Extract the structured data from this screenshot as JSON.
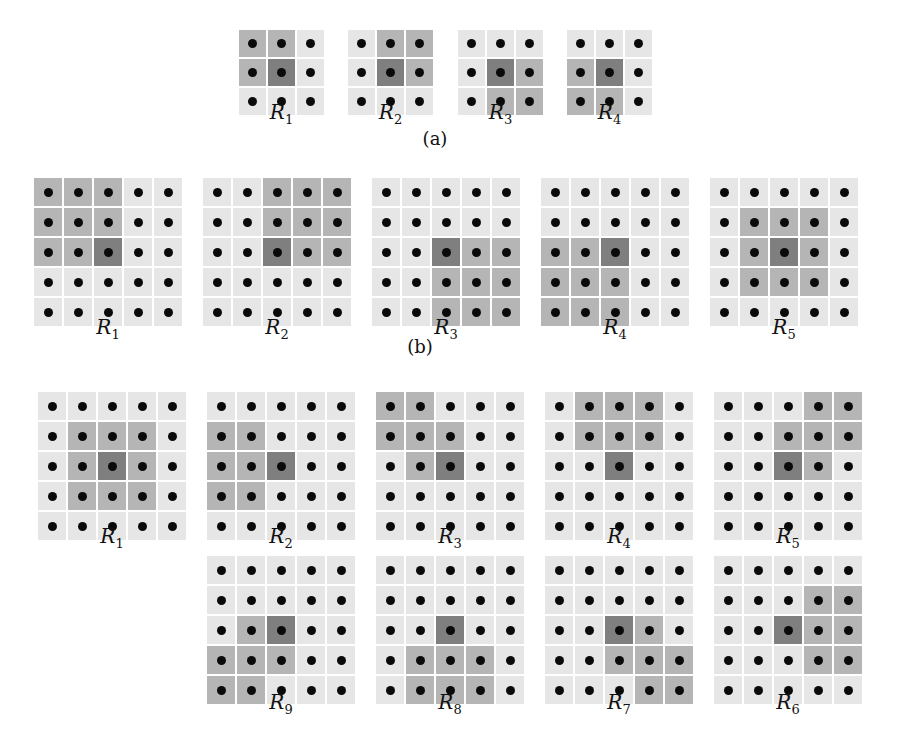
{
  "colors": {
    "light": "#e6e6e6",
    "medium": "#b5b5b5",
    "dark": "#7f7f7f",
    "dot": "#0a0a0a"
  },
  "panels": [
    {
      "caption": "(a)",
      "caption_x": 435,
      "caption_y": 128,
      "size": 3,
      "cell": 27,
      "gap": 2,
      "y": 30,
      "label_y": 100,
      "regions": [
        {
          "label": "R",
          "sub": "1",
          "x": 239,
          "shaded": [
            [
              0,
              0
            ],
            [
              0,
              1
            ],
            [
              1,
              0
            ]
          ]
        },
        {
          "label": "R",
          "sub": "2",
          "x": 348,
          "shaded": [
            [
              0,
              1
            ],
            [
              0,
              2
            ],
            [
              1,
              2
            ]
          ]
        },
        {
          "label": "R",
          "sub": "3",
          "x": 458,
          "shaded": [
            [
              1,
              2
            ],
            [
              2,
              1
            ],
            [
              2,
              2
            ]
          ]
        },
        {
          "label": "R",
          "sub": "4",
          "x": 567,
          "shaded": [
            [
              1,
              0
            ],
            [
              2,
              0
            ],
            [
              2,
              1
            ]
          ]
        }
      ]
    },
    {
      "caption": "(b)",
      "caption_x": 420,
      "caption_y": 336,
      "size": 5,
      "cell": 28,
      "gap": 2,
      "y": 178,
      "label_y": 315,
      "regions": [
        {
          "label": "R",
          "sub": "1",
          "x": 34,
          "shaded": [
            [
              0,
              0
            ],
            [
              0,
              1
            ],
            [
              0,
              2
            ],
            [
              1,
              0
            ],
            [
              1,
              1
            ],
            [
              1,
              2
            ],
            [
              2,
              0
            ],
            [
              2,
              1
            ]
          ]
        },
        {
          "label": "R",
          "sub": "2",
          "x": 203,
          "shaded": [
            [
              0,
              2
            ],
            [
              0,
              3
            ],
            [
              0,
              4
            ],
            [
              1,
              2
            ],
            [
              1,
              3
            ],
            [
              1,
              4
            ],
            [
              2,
              3
            ],
            [
              2,
              4
            ]
          ]
        },
        {
          "label": "R",
          "sub": "3",
          "x": 372,
          "shaded": [
            [
              2,
              3
            ],
            [
              2,
              4
            ],
            [
              3,
              2
            ],
            [
              3,
              3
            ],
            [
              3,
              4
            ],
            [
              4,
              2
            ],
            [
              4,
              3
            ],
            [
              4,
              4
            ]
          ]
        },
        {
          "label": "R",
          "sub": "4",
          "x": 541,
          "shaded": [
            [
              2,
              0
            ],
            [
              2,
              1
            ],
            [
              3,
              0
            ],
            [
              3,
              1
            ],
            [
              3,
              2
            ],
            [
              4,
              0
            ],
            [
              4,
              1
            ],
            [
              4,
              2
            ]
          ]
        },
        {
          "label": "R",
          "sub": "5",
          "x": 710,
          "shaded": [
            [
              1,
              1
            ],
            [
              1,
              2
            ],
            [
              1,
              3
            ],
            [
              2,
              1
            ],
            [
              2,
              3
            ],
            [
              3,
              1
            ],
            [
              3,
              2
            ],
            [
              3,
              3
            ]
          ]
        }
      ]
    },
    {
      "caption": "",
      "size": 5,
      "cell": 28,
      "gap": 2,
      "y": 392,
      "label_y": 524,
      "regions": [
        {
          "label": "R",
          "sub": "1",
          "x": 38,
          "shaded": [
            [
              1,
              1
            ],
            [
              1,
              2
            ],
            [
              1,
              3
            ],
            [
              2,
              1
            ],
            [
              2,
              3
            ],
            [
              3,
              1
            ],
            [
              3,
              2
            ],
            [
              3,
              3
            ]
          ]
        },
        {
          "label": "R",
          "sub": "2",
          "x": 207,
          "shaded": [
            [
              1,
              0
            ],
            [
              1,
              1
            ],
            [
              2,
              0
            ],
            [
              2,
              1
            ],
            [
              3,
              0
            ],
            [
              3,
              1
            ]
          ]
        },
        {
          "label": "R",
          "sub": "3",
          "x": 376,
          "shaded": [
            [
              0,
              0
            ],
            [
              0,
              1
            ],
            [
              1,
              0
            ],
            [
              1,
              1
            ],
            [
              1,
              2
            ],
            [
              2,
              1
            ]
          ]
        },
        {
          "label": "R",
          "sub": "4",
          "x": 545,
          "shaded": [
            [
              0,
              1
            ],
            [
              0,
              2
            ],
            [
              0,
              3
            ],
            [
              1,
              1
            ],
            [
              1,
              2
            ],
            [
              1,
              3
            ]
          ]
        },
        {
          "label": "R",
          "sub": "5",
          "x": 714,
          "shaded": [
            [
              0,
              3
            ],
            [
              0,
              4
            ],
            [
              1,
              2
            ],
            [
              1,
              3
            ],
            [
              1,
              4
            ],
            [
              2,
              3
            ]
          ]
        }
      ]
    },
    {
      "caption": "",
      "size": 5,
      "cell": 28,
      "gap": 2,
      "y": 556,
      "label_y": 690,
      "regions": [
        {
          "label": "R",
          "sub": "9",
          "x": 207,
          "shaded": [
            [
              2,
              1
            ],
            [
              3,
              0
            ],
            [
              3,
              1
            ],
            [
              3,
              2
            ],
            [
              4,
              0
            ],
            [
              4,
              1
            ]
          ]
        },
        {
          "label": "R",
          "sub": "8",
          "x": 376,
          "shaded": [
            [
              3,
              1
            ],
            [
              3,
              2
            ],
            [
              3,
              3
            ],
            [
              4,
              1
            ],
            [
              4,
              2
            ],
            [
              4,
              3
            ]
          ]
        },
        {
          "label": "R",
          "sub": "7",
          "x": 545,
          "shaded": [
            [
              2,
              3
            ],
            [
              3,
              2
            ],
            [
              3,
              3
            ],
            [
              3,
              4
            ],
            [
              4,
              3
            ],
            [
              4,
              4
            ]
          ]
        },
        {
          "label": "R",
          "sub": "6",
          "x": 714,
          "shaded": [
            [
              1,
              3
            ],
            [
              1,
              4
            ],
            [
              2,
              3
            ],
            [
              2,
              4
            ],
            [
              3,
              3
            ],
            [
              3,
              4
            ]
          ]
        }
      ]
    }
  ]
}
